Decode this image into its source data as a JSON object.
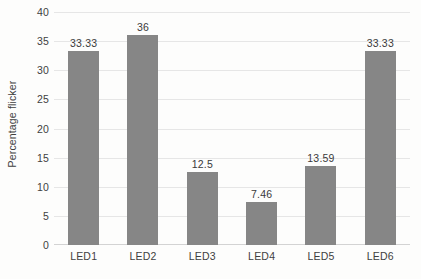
{
  "chart_data": {
    "type": "bar",
    "title": "",
    "subtitle": "",
    "xlabel": "",
    "ylabel": "Percentage flicker",
    "categories": [
      "LED1",
      "LED2",
      "LED3",
      "LED4",
      "LED5",
      "LED6"
    ],
    "values": [
      33.33,
      36,
      12.5,
      7.46,
      13.59,
      33.33
    ],
    "data_labels": [
      "33.33",
      "36",
      "12.5",
      "7.46",
      "13.59",
      "33.33"
    ],
    "ylim": [
      0,
      40
    ],
    "ytick_step": 5,
    "yticks": [
      40,
      35,
      30,
      25,
      20,
      15,
      10,
      5,
      0
    ],
    "ytick_labels": [
      "40",
      "35",
      "30",
      "25",
      "20",
      "15",
      "10",
      "5",
      "0"
    ],
    "grid": "horizontal",
    "legend": "none",
    "series": [
      {
        "name": "Percentage flicker",
        "values": [
          33.33,
          36,
          12.5,
          7.46,
          13.59,
          33.33
        ]
      }
    ],
    "colors": {
      "bar": "#868686",
      "gridline": "#e6e6e6",
      "axis": "#d3d3d3",
      "text": "#3f3f3f",
      "background": "#fdfdfc"
    }
  }
}
